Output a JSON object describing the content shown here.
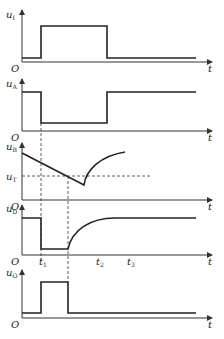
{
  "diagram": {
    "origin_label": "O",
    "time_label": "t",
    "panels": [
      {
        "id": "uI",
        "label_main": "u",
        "label_sub": "I",
        "axis_y": 62
      },
      {
        "id": "uA",
        "label_main": "u",
        "label_sub": "A",
        "axis_y": 131
      },
      {
        "id": "uB",
        "label_main": "u",
        "label_sub": "B",
        "axis_y": 200
      },
      {
        "id": "uD",
        "label_main": "u",
        "label_sub": "D",
        "axis_y": 255
      },
      {
        "id": "uO",
        "label_main": "u",
        "label_sub": "O",
        "axis_y": 318
      }
    ],
    "threshold": {
      "label_main": "u",
      "label_sub": "T"
    },
    "time_marks": [
      {
        "label_main": "t",
        "label_sub": "1"
      },
      {
        "label_main": "t",
        "label_sub": "2"
      },
      {
        "label_main": "t",
        "label_sub": "3"
      }
    ]
  }
}
